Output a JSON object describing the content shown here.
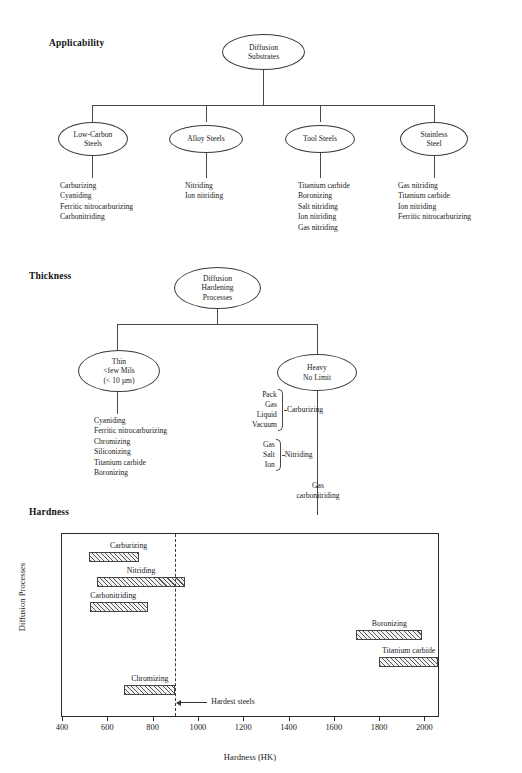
{
  "sections": {
    "applicability": {
      "title": "Applicability",
      "root": {
        "lines": [
          "Diffusion",
          "Substrates"
        ]
      },
      "branches": [
        {
          "node": {
            "lines": [
              "Low-Carbon",
              "Steels"
            ]
          },
          "items": [
            "Carburizing",
            "Cyaniding",
            "Ferritic nitrocarburizing",
            "Carbonitriding"
          ]
        },
        {
          "node": {
            "lines": [
              "Alloy Steels"
            ]
          },
          "items": [
            "Nitriding",
            "Ion nitriding"
          ]
        },
        {
          "node": {
            "lines": [
              "Tool Steels"
            ]
          },
          "items": [
            "Titanium carbide",
            "Boronizing",
            "Salt nitriding",
            "Ion nitriding",
            "Gas nitriding"
          ]
        },
        {
          "node": {
            "lines": [
              "Stainless",
              "Steel"
            ]
          },
          "items": [
            "Gas nitriding",
            "Titanium carbide",
            "Ion nitriding",
            "Ferritic nitrocarburizing"
          ]
        }
      ]
    },
    "thickness": {
      "title": "Thickness",
      "root": {
        "lines": [
          "Diffusion",
          "Hardening",
          "Processes"
        ]
      },
      "thin": {
        "node": {
          "lines": [
            "Thin",
            "<few Mils",
            "(< 10 µm)"
          ]
        },
        "items": [
          "Cyaniding",
          "Ferritic nitrocarburizing",
          "Chromizing",
          "Siliconizing",
          "Titanium carbide",
          "Boronizing"
        ]
      },
      "heavy": {
        "node": {
          "lines": [
            "Heavy",
            "No Limit"
          ]
        },
        "groups": [
          {
            "items": [
              "Pack",
              "Gas",
              "Liquid",
              "Vacuum"
            ],
            "label": "Carburizing"
          },
          {
            "items": [
              "Gas",
              "Salt",
              "Ion"
            ],
            "label": "Nitriding"
          }
        ],
        "tail": {
          "lines": [
            "Gas",
            "carbonitriding"
          ]
        }
      }
    },
    "hardness": {
      "title": "Hardness"
    }
  },
  "chart_data": {
    "type": "bar",
    "orientation": "horizontal",
    "title": "Hardness",
    "xlabel": "Hardness (HK)",
    "ylabel": "Diffusion Processes",
    "xlim": [
      400,
      2060
    ],
    "ylim": [
      0,
      100
    ],
    "grid": false,
    "legend": null,
    "xticks": [
      400,
      600,
      800,
      1000,
      1200,
      1400,
      1600,
      1800,
      2000
    ],
    "xtick_labels": [
      "400",
      "600",
      "800",
      "1000",
      "1200",
      "1400",
      "1600",
      "1800",
      "2000"
    ],
    "bars": [
      {
        "name": "Carburizing",
        "x0": 520,
        "x1": 740,
        "row": 0,
        "label_side": "above-right"
      },
      {
        "name": "Nitriding",
        "x0": 555,
        "x1": 945,
        "row": 1,
        "label_side": "above-center"
      },
      {
        "name": "Carbonitriding",
        "x0": 525,
        "x1": 780,
        "row": 2,
        "label_side": "above-left"
      },
      {
        "name": "Boronizing",
        "x0": 1700,
        "x1": 1990,
        "row": 3,
        "label_side": "above-center"
      },
      {
        "name": "Titanium carbide",
        "x0": 1800,
        "x1": 2060,
        "row": 4,
        "label_side": "above-center"
      },
      {
        "name": "Chromizing",
        "x0": 675,
        "x1": 900,
        "row": 5,
        "label_side": "above-center"
      }
    ],
    "threshold": {
      "value": 900,
      "label": "Hardest steels",
      "style": "dashed"
    }
  }
}
